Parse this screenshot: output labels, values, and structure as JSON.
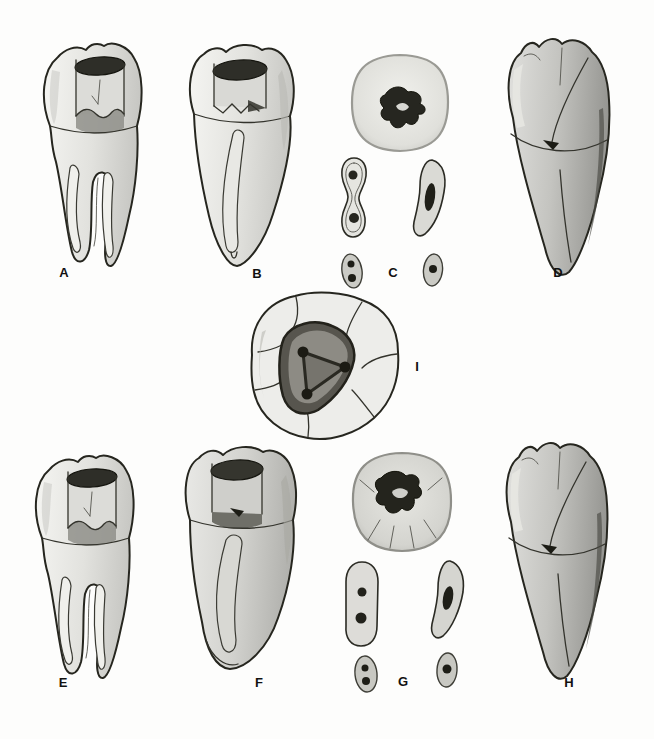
{
  "figure": {
    "background_color": "#fdfdfc",
    "ink_color": "#26261f",
    "pulp_color": "#2a2a24",
    "light_fill": "#efefec",
    "mid_fill": "#d6d6d2",
    "dark_fill": "#aaaaa6"
  },
  "panels": [
    {
      "label": "A",
      "illustration": "sectioned-two-root-molar-proximal-view"
    },
    {
      "label": "B",
      "illustration": "sectioned-molar-side-view-single-canal"
    },
    {
      "label": "C",
      "illustration": "root-cross-sections-crown-mid-apical"
    },
    {
      "label": "D",
      "illustration": "shaded-molar-side-view-fused-root"
    },
    {
      "label": "E",
      "illustration": "sectioned-two-root-molar-proximal-view"
    },
    {
      "label": "F",
      "illustration": "sectioned-molar-side-view-single-canal"
    },
    {
      "label": "G",
      "illustration": "root-cross-sections-crown-mid-apical"
    },
    {
      "label": "H",
      "illustration": "shaded-molar-side-view-fused-root"
    },
    {
      "label": "I",
      "illustration": "occlusal-view-access-cavity-three-canal-orifices"
    }
  ]
}
